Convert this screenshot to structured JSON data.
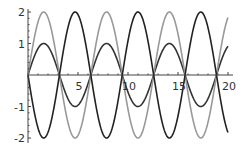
{
  "chart_data": {
    "type": "line",
    "title": "",
    "xlabel": "",
    "ylabel": "",
    "xlim": [
      0,
      20
    ],
    "ylim": [
      -2,
      2
    ],
    "grid": false,
    "legend": null,
    "x_ticks": [
      5,
      10,
      15,
      20
    ],
    "y_ticks": [
      -2,
      -1,
      1,
      2
    ],
    "x_tick_labels": [
      "5",
      "10",
      "15",
      "20"
    ],
    "y_tick_labels": [
      "-2",
      "-1",
      "1",
      "2"
    ],
    "series": [
      {
        "name": "sin(x)",
        "expr": "sin",
        "amplitude": 1,
        "color": "#333333",
        "x_range": [
          0,
          20
        ]
      },
      {
        "name": "2 sin(x)",
        "expr": "sin",
        "amplitude": 2,
        "color": "#999999",
        "x_range": [
          0,
          20
        ]
      },
      {
        "name": "-2 sin(x)",
        "expr": "sin",
        "amplitude": -2,
        "color": "#222222",
        "x_range": [
          0,
          20
        ]
      }
    ]
  }
}
